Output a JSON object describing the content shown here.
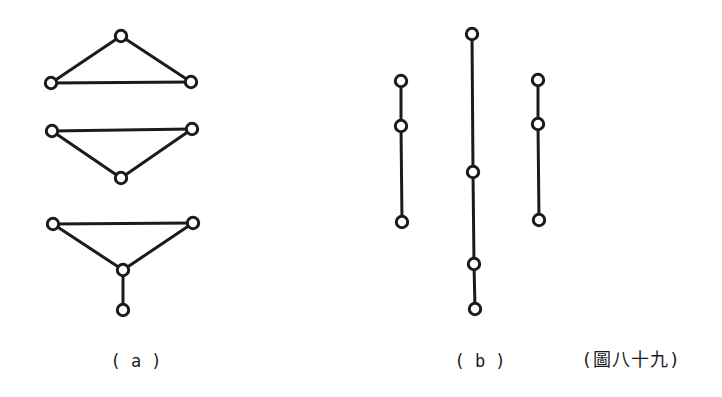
{
  "figure": {
    "label_a": "( a )",
    "label_b": "( b )",
    "caption": "(圖八十九)"
  },
  "style": {
    "ink": "#1b1b1b",
    "background": "#ffffff",
    "node_fill": "#ffffff",
    "node_radius": 5.7,
    "node_stroke_width": 3,
    "edge_stroke_width": 3
  },
  "diagram": {
    "canvas": {
      "width": 722,
      "height": 397
    },
    "groups": [
      {
        "name": "a-triangle-up",
        "nodes": [
          [
            121,
            36
          ],
          [
            51,
            83
          ],
          [
            191,
            82
          ]
        ],
        "edges": [
          [
            0,
            1
          ],
          [
            0,
            2
          ],
          [
            1,
            2
          ]
        ]
      },
      {
        "name": "a-triangle-down",
        "nodes": [
          [
            52,
            131
          ],
          [
            192,
            129
          ],
          [
            121,
            178
          ]
        ],
        "edges": [
          [
            0,
            1
          ],
          [
            0,
            2
          ],
          [
            1,
            2
          ]
        ]
      },
      {
        "name": "a-triangle-with-pendant",
        "nodes": [
          [
            53,
            224
          ],
          [
            193,
            223
          ],
          [
            123,
            270
          ],
          [
            123,
            310
          ]
        ],
        "edges": [
          [
            0,
            1
          ],
          [
            0,
            2
          ],
          [
            1,
            2
          ],
          [
            2,
            3
          ]
        ]
      },
      {
        "name": "b-path-left",
        "nodes": [
          [
            401,
            81
          ],
          [
            401,
            126
          ],
          [
            402,
            222
          ]
        ],
        "edges": [
          [
            0,
            1
          ],
          [
            1,
            2
          ]
        ]
      },
      {
        "name": "b-path-middle",
        "nodes": [
          [
            472,
            34
          ],
          [
            473,
            172
          ],
          [
            474,
            264
          ],
          [
            475,
            309
          ]
        ],
        "edges": [
          [
            0,
            1
          ],
          [
            1,
            2
          ],
          [
            2,
            3
          ]
        ]
      },
      {
        "name": "b-path-right",
        "nodes": [
          [
            538,
            80
          ],
          [
            538,
            124
          ],
          [
            539,
            220
          ]
        ],
        "edges": [
          [
            0,
            1
          ],
          [
            1,
            2
          ]
        ]
      }
    ]
  }
}
